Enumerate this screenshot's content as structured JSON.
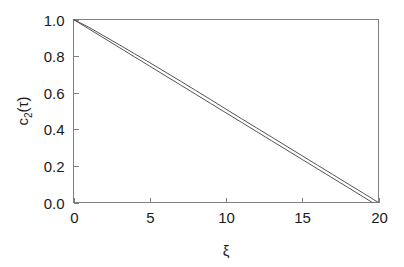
{
  "chart_data": {
    "type": "line",
    "title": "",
    "subtitle": "",
    "xlabel": "ξ",
    "ylabel": "c₂(τ)",
    "ylabel_base": "c",
    "ylabel_subscript": "2",
    "ylabel_suffix": "(τ)",
    "xlim": [
      0,
      20
    ],
    "ylim": [
      0.0,
      1.0
    ],
    "xticks": [
      0,
      5,
      10,
      15,
      20
    ],
    "xtick_labels": [
      "0",
      "5",
      "10",
      "15",
      "20"
    ],
    "yticks": [
      0.0,
      0.2,
      0.4,
      0.6,
      0.8,
      1.0
    ],
    "ytick_labels": [
      "0.0",
      "0.2",
      "0.4",
      "0.6",
      "0.8",
      "1.0"
    ],
    "grid": false,
    "legend": false,
    "legend_position": "none",
    "frame": "box",
    "tick_direction": "in",
    "line_color": "#555555",
    "frame_color": "#808080",
    "background_color": "#ffffff",
    "series": [
      {
        "name": "curve-upper",
        "x": [
          0,
          1,
          2,
          3,
          4,
          5,
          6,
          7,
          8,
          9,
          10,
          11,
          12,
          13,
          14,
          15,
          16,
          17,
          18,
          19,
          19.6
        ],
        "values": [
          1.0,
          0.949,
          0.898,
          0.847,
          0.796,
          0.745,
          0.694,
          0.643,
          0.592,
          0.541,
          0.49,
          0.439,
          0.388,
          0.337,
          0.286,
          0.235,
          0.184,
          0.133,
          0.082,
          0.031,
          0.0
        ]
      },
      {
        "name": "curve-lower",
        "x": [
          0,
          1,
          2,
          3,
          4,
          5,
          6,
          7,
          8,
          9,
          10,
          11,
          12,
          13,
          14,
          15,
          16,
          17,
          18,
          19,
          20
        ],
        "values": [
          1.0,
          0.958,
          0.91,
          0.862,
          0.813,
          0.764,
          0.714,
          0.664,
          0.613,
          0.562,
          0.51,
          0.459,
          0.408,
          0.357,
          0.306,
          0.255,
          0.204,
          0.153,
          0.102,
          0.051,
          0.0
        ]
      }
    ]
  }
}
